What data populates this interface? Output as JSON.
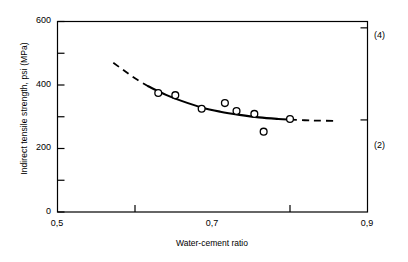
{
  "chart_data": {
    "type": "scatter",
    "title": "",
    "xlabel": "Water-cement ratio",
    "ylabel": "Indirect tensile strength, psi (MPa)",
    "xlim": [
      0.5,
      0.9
    ],
    "ylim": [
      0,
      600
    ],
    "grid": false,
    "legend": null,
    "x_tick_labels": [
      "0,5",
      "0,7",
      "0,9"
    ],
    "x_tick_values": [
      0.5,
      0.7,
      0.9
    ],
    "x_minor_ticks": [
      0.6,
      0.8
    ],
    "y_tick_labels": [
      "0",
      "200",
      "400",
      "600"
    ],
    "y_tick_values": [
      0,
      200,
      400,
      600
    ],
    "y_minor_ticks": [
      100,
      300,
      500
    ],
    "right_axis": {
      "labels": [
        "(2)",
        "(4)"
      ],
      "values": [
        290,
        580
      ],
      "unit": "MPa"
    },
    "points": [
      {
        "x": 0.63,
        "y": 375
      },
      {
        "x": 0.652,
        "y": 368
      },
      {
        "x": 0.686,
        "y": 325
      },
      {
        "x": 0.716,
        "y": 343
      },
      {
        "x": 0.731,
        "y": 318
      },
      {
        "x": 0.754,
        "y": 309
      },
      {
        "x": 0.766,
        "y": 253
      },
      {
        "x": 0.8,
        "y": 293
      }
    ],
    "fit_curve_solid": [
      {
        "x": 0.617,
        "y": 396
      },
      {
        "x": 0.64,
        "y": 369
      },
      {
        "x": 0.66,
        "y": 350
      },
      {
        "x": 0.686,
        "y": 329
      },
      {
        "x": 0.71,
        "y": 316
      },
      {
        "x": 0.735,
        "y": 306
      },
      {
        "x": 0.76,
        "y": 298
      },
      {
        "x": 0.785,
        "y": 293
      },
      {
        "x": 0.8,
        "y": 291
      }
    ],
    "fit_curve_dash_left": [
      {
        "x": 0.572,
        "y": 470
      },
      {
        "x": 0.585,
        "y": 447
      },
      {
        "x": 0.6,
        "y": 421
      },
      {
        "x": 0.617,
        "y": 396
      }
    ],
    "fit_curve_dash_right": [
      {
        "x": 0.8,
        "y": 291
      },
      {
        "x": 0.83,
        "y": 288
      },
      {
        "x": 0.86,
        "y": 287
      }
    ],
    "marker_style": "open-circle",
    "colors": {
      "axis": "#000000",
      "curve": "#000000",
      "marker_stroke": "#000000",
      "background": "#ffffff"
    }
  }
}
